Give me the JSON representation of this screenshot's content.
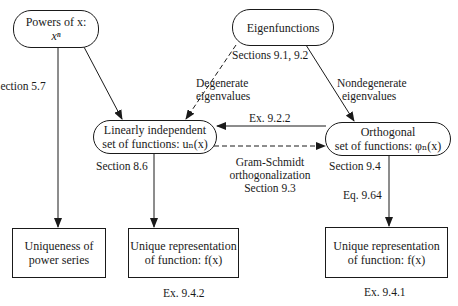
{
  "diagram": {
    "nodes": {
      "powers": {
        "line1": "Powers of x:",
        "line2": "xⁿ"
      },
      "eigen": {
        "line1": "Eigenfunctions"
      },
      "linind": {
        "line1": "Linearly independent",
        "line2": "set of functions: uₙ(x)"
      },
      "ortho": {
        "line1": "Orthogonal",
        "line2": "set of functions: φₙ(x)"
      },
      "uniq_power": {
        "line1": "Uniqueness of",
        "line2": "power series"
      },
      "uniq_rep_mid": {
        "line1": "Unique representation",
        "line2": "of function: f(x)"
      },
      "uniq_rep_right": {
        "line1": "Unique representation",
        "line2": "of function: f(x)"
      }
    },
    "labels": {
      "section_5_7": "Section 5.7",
      "sections_9_1_9_2": "Sections 9.1, 9.2",
      "degenerate_1": "Degenerate",
      "degenerate_2": "eigenvalues",
      "nondegenerate_1": "Nondegenerate",
      "nondegenerate_2": "eigenvalues",
      "ex_9_2_2": "Ex. 9.2.2",
      "gram_1": "Gram-Schmidt",
      "gram_2": "orthogonalization",
      "gram_3": "Section 9.3",
      "section_8_6": "Section 8.6",
      "section_9_4": "Section 9.4",
      "eq_9_64": "Eq. 9.64",
      "ex_9_4_2": "Ex. 9.4.2",
      "ex_9_4_1": "Ex. 9.4.1"
    },
    "edges": [
      {
        "from": "powers",
        "to": "uniq_power",
        "label": "Section 5.7",
        "style": "solid"
      },
      {
        "from": "powers",
        "to": "linind",
        "style": "solid"
      },
      {
        "from": "eigen",
        "to": "linind",
        "label": "Degenerate eigenvalues",
        "style": "dashed"
      },
      {
        "from": "eigen",
        "to": "ortho",
        "label": "Nondegenerate eigenvalues",
        "style": "solid"
      },
      {
        "from": "ortho",
        "to": "linind",
        "label": "Ex. 9.2.2",
        "style": "solid"
      },
      {
        "from": "linind",
        "to": "ortho",
        "label": "Gram-Schmidt orthogonalization Section 9.3",
        "style": "dashed"
      },
      {
        "from": "linind",
        "to": "uniq_rep_mid",
        "label": "Section 8.6",
        "style": "solid"
      },
      {
        "from": "ortho",
        "to": "uniq_rep_right",
        "label": "Section 9.4 / Eq. 9.64",
        "style": "solid"
      }
    ],
    "colors": {
      "ink": "#1a1a1a",
      "background": "#ffffff"
    }
  }
}
